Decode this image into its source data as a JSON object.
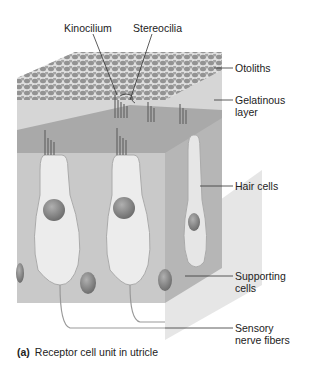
{
  "figure": {
    "labels": {
      "kinocilium": "Kinocilium",
      "stereocilia": "Stereocilia",
      "otoliths": "Otoliths",
      "gelatinous_layer_1": "Gelatinous",
      "gelatinous_layer_2": "layer",
      "hair_cells": "Hair cells",
      "supporting_cells_1": "Supporting",
      "supporting_cells_2": "cells",
      "sensory_nerve_1": "Sensory",
      "sensory_nerve_2": "nerve fibers"
    },
    "caption": {
      "letter": "(a)",
      "text": "Receptor cell unit in utricle"
    },
    "colors": {
      "otolith_layer": "#9a9a9a",
      "gel_layer": "#d4d4d4",
      "tissue_front": "#c8c8c8",
      "tissue_side": "#b4b4b4",
      "cell_fill": "#e8e8e8",
      "nucleus": "#8a8a8a"
    }
  }
}
